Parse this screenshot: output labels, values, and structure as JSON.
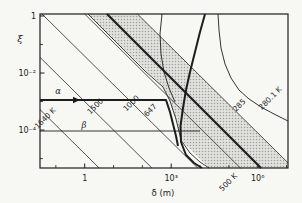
{
  "figure": {
    "width": 302,
    "height": 203,
    "paper_color": "#f7f7f4",
    "ink_color": "#1d1d1b",
    "thin_line_color": "#2a2a28",
    "band_fill": "#e1e1dd",
    "band_dot_color": "#a0a09b"
  },
  "chart_data": {
    "type": "line",
    "title": "",
    "xlabel": "δ  (m)",
    "ylabel": "ξ",
    "x_scale": "log",
    "y_scale": "log",
    "x_range_log": [
      -1.55,
      7.05
    ],
    "y_range_log": [
      0.07,
      -5.33
    ],
    "plot_px": {
      "l": 40,
      "t": 14,
      "r": 288,
      "b": 168
    },
    "x_ticks": [
      {
        "log": 0,
        "label": "1"
      },
      {
        "log": 3,
        "label": "10³"
      },
      {
        "log": 6,
        "label": "10⁶"
      }
    ],
    "x_minor_logs": [
      -1,
      1,
      2,
      4,
      5,
      7
    ],
    "y_ticks": [
      {
        "log": 0,
        "label": "1"
      },
      {
        "log": -2,
        "label": "10⁻²"
      },
      {
        "log": -4,
        "label": "10⁻⁴"
      }
    ],
    "y_minor_logs": [
      -1,
      -3,
      -5
    ],
    "isotherms": [
      {
        "label": "1640 K",
        "temperature_K": 1640,
        "c": -4.83,
        "label_px": [
          47,
          120
        ],
        "label_rotation": -45
      },
      {
        "label": "1500",
        "temperature_K": 1500,
        "c": -3.0,
        "label_px": [
          97,
          108
        ],
        "label_rotation": -45
      },
      {
        "label": "1000",
        "temperature_K": 1000,
        "c": -1.41,
        "label_px": [
          133,
          105
        ],
        "label_rotation": -45
      },
      {
        "label": "500 K",
        "temperature_K": 500,
        "c": 0.07,
        "label_px": [
          230,
          184
        ],
        "label_rotation": -45
      },
      {
        "label": "285",
        "temperature_K": 285,
        "c": 1.9,
        "label_px": [
          241,
          107
        ],
        "label_rotation": -45
      }
    ],
    "curve_labels": [
      {
        "label": "647",
        "temperature_K": 647,
        "label_px": [
          152,
          112
        ],
        "label_rotation": -45
      },
      {
        "label": "280.1 K",
        "temperature_K": 280.1,
        "label_px": [
          272,
          100
        ],
        "label_rotation": -45
      }
    ],
    "band": {
      "outline_px": [
        [
          88,
          14
        ],
        [
          137.5,
          14
        ],
        [
          288,
          163
        ],
        [
          288,
          168
        ],
        [
          209,
          168
        ],
        [
          181,
          140
        ],
        [
          175,
          118
        ],
        [
          169,
          100
        ],
        [
          163,
          87
        ]
      ],
      "left_edge_px": [
        [
          88,
          14
        ],
        [
          120,
          46
        ],
        [
          145,
          71
        ],
        [
          163,
          87
        ],
        [
          170,
          101
        ],
        [
          176,
          119
        ],
        [
          181,
          140
        ],
        [
          190,
          153
        ],
        [
          200,
          162
        ],
        [
          209,
          168
        ]
      ]
    },
    "curves": [
      {
        "name": "alpha-trajectory",
        "width": 2.0,
        "points_px": [
          [
            40,
            100
          ],
          [
            166,
            100
          ],
          [
            170,
            112
          ],
          [
            173,
            124
          ],
          [
            176,
            136
          ],
          [
            178,
            146
          ]
        ]
      },
      {
        "name": "beta-trajectory",
        "width": 0.9,
        "points_px": [
          [
            40,
            131
          ],
          [
            200,
            131
          ]
        ]
      },
      {
        "name": "thick-diagonal",
        "width": 2.2,
        "points_px": [
          [
            107,
            14
          ],
          [
            261,
            168
          ]
        ]
      },
      {
        "name": "steep-thick-curve",
        "width": 2.0,
        "points_px": [
          [
            205,
            14
          ],
          [
            200,
            32
          ],
          [
            195,
            52
          ],
          [
            190,
            72
          ],
          [
            186,
            90
          ],
          [
            183,
            108
          ],
          [
            180.5,
            126
          ],
          [
            181,
            142
          ],
          [
            186,
            155
          ],
          [
            194,
            163
          ],
          [
            202,
            168
          ]
        ]
      },
      {
        "name": "steep-thin-curve",
        "width": 0.9,
        "points_px": [
          [
            162,
            14
          ],
          [
            160,
            34
          ],
          [
            161,
            54
          ],
          [
            164,
            72
          ],
          [
            169,
            88
          ],
          [
            175,
            102
          ]
        ]
      },
      {
        "name": "hyperbola-280K",
        "width": 0.9,
        "points_px": [
          [
            218,
            14
          ],
          [
            219,
            30
          ],
          [
            221,
            48
          ],
          [
            225,
            64
          ],
          [
            231,
            78
          ],
          [
            239,
            90
          ],
          [
            249,
            99
          ],
          [
            261,
            107
          ],
          [
            274,
            114
          ],
          [
            288,
            121
          ]
        ]
      }
    ],
    "annotations": [
      {
        "label": "α",
        "px": [
          58,
          94
        ],
        "italic": true
      },
      {
        "label": "β",
        "px": [
          84,
          128
        ],
        "italic": true
      }
    ],
    "arrow": {
      "on": "alpha-trajectory",
      "head_px": [
        [
          73,
          96.8
        ],
        [
          80,
          100
        ],
        [
          73,
          103.2
        ]
      ]
    }
  }
}
